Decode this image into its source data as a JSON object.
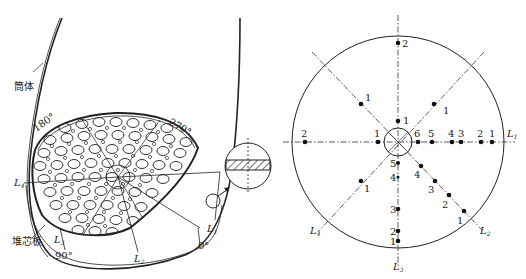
{
  "left_diagram": {
    "labels": {
      "shell": "筒体",
      "core_plate": "堆芯板",
      "angle_180": "180°",
      "angle_270": "270°",
      "angle_90": "90°",
      "angle_0": "0°",
      "L1": "L",
      "L1_sub": "1",
      "L2": "L",
      "L2_sub": "2",
      "L3": "L",
      "L3_sub": "3",
      "L4": "L",
      "L4_sub": "4"
    },
    "detail_inset": "hatched cross-section detail"
  },
  "right_diagram": {
    "lines": {
      "L1": {
        "label": "L",
        "sub": "1"
      },
      "L2": {
        "label": "L",
        "sub": "2"
      },
      "L3": {
        "label": "L",
        "sub": "3"
      },
      "L4": {
        "label": "L",
        "sub": "4"
      }
    },
    "points": {
      "top_2": "2",
      "upper_left_1": "1",
      "upper_right_1": "1",
      "up_inner_1": "1",
      "left_2": "2",
      "left_inner_1": "1",
      "right_6": "6",
      "right_5": "5",
      "right_4": "4",
      "right_3": "3",
      "right_2": "2",
      "right_1": "1",
      "down_5": "5",
      "down_4": "4",
      "down_3": "3",
      "down_2": "2",
      "down_1": "1",
      "diag_4": "4",
      "diag_3": "3",
      "diag_2": "2",
      "diag_1": "1",
      "lower_left_1": "1"
    }
  }
}
